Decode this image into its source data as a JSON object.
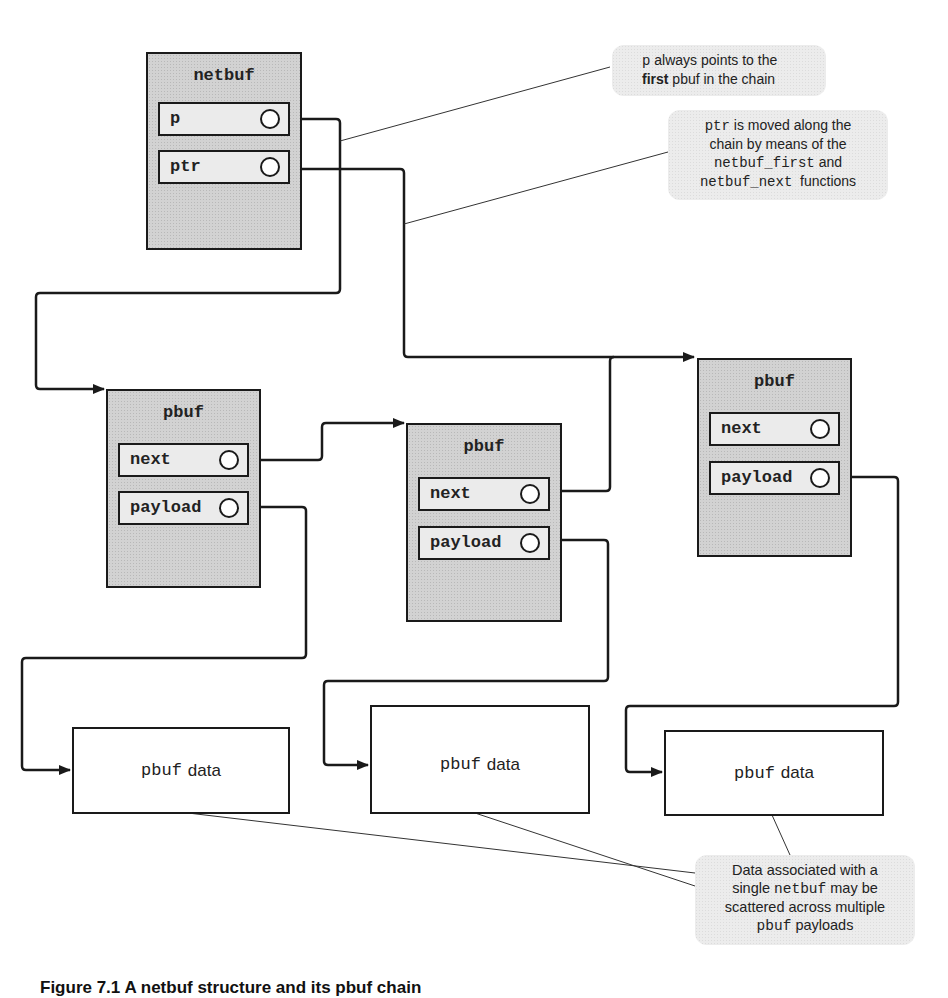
{
  "netbuf": {
    "title": "netbuf",
    "fields": [
      {
        "label": "p"
      },
      {
        "label": "ptr"
      }
    ]
  },
  "pbufs": [
    {
      "title": "pbuf",
      "fields": [
        {
          "label": "next"
        },
        {
          "label": "payload"
        }
      ]
    },
    {
      "title": "pbuf",
      "fields": [
        {
          "label": "next"
        },
        {
          "label": "payload"
        }
      ]
    },
    {
      "title": "pbuf",
      "fields": [
        {
          "label": "next"
        },
        {
          "label": "payload"
        }
      ]
    }
  ],
  "data_boxes": [
    {
      "code": "pbuf",
      "word": "data"
    },
    {
      "code": "pbuf",
      "word": "data"
    },
    {
      "code": "pbuf",
      "word": "data"
    }
  ],
  "callouts": {
    "p_note": {
      "line1_code": "p",
      "line1_text": " always points to the",
      "line2_bold": "first",
      "line2_text": " pbuf in the chain"
    },
    "ptr_note": {
      "line1_code": "ptr",
      "line1_text": " is moved along the",
      "line2_text": "chain by means of the",
      "line3_code": "netbuf_first",
      "line3_text": " and",
      "line4_code": "netbuf_next",
      "line4_text": "  functions"
    },
    "data_note": {
      "line1_text": "Data associated with a",
      "line2_pre": "single ",
      "line2_code": "netbuf",
      "line2_post": " may be",
      "line3_text": "scattered across multiple",
      "line4_code": "pbuf",
      "line4_text": " payloads"
    }
  },
  "caption": "Figure 7.1  A netbuf structure and its pbuf chain",
  "colors": {
    "line": "#1a1a1a",
    "box_fill": "#d2d2d2",
    "callout_fill": "#ececec"
  }
}
